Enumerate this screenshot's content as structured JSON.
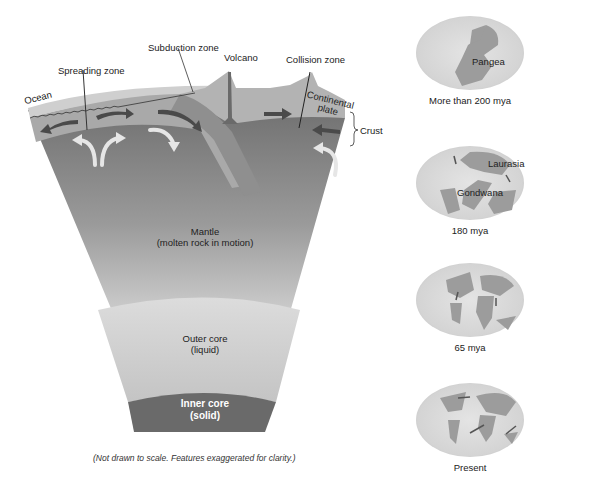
{
  "cross_section": {
    "labels": {
      "ocean": "Ocean",
      "spreading_zone": "Spreading zone",
      "subduction_zone": "Subduction zone",
      "volcano": "Volcano",
      "collision_zone": "Collision zone",
      "continental_plate_line1": "Continental",
      "continental_plate_line2": "plate",
      "crust": "Crust",
      "mantle_title": "Mantle",
      "mantle_desc": "(molten rock in motion)",
      "outer_core_title": "Outer core",
      "outer_core_desc": "(liquid)",
      "inner_core_title": "Inner core",
      "inner_core_desc": "(solid)"
    },
    "caption": "(Not drawn to scale. Features exaggerated for clarity.)",
    "colors": {
      "ocean": "#c9c9c9",
      "crust": "#a6a6a6",
      "upper_mantle": "#6f6f6f",
      "mantle_light": "#c8c8c8",
      "outer_core": "#d2d2d2",
      "inner_core": "#6a6a6a",
      "arrow_dark": "#4a4a4a",
      "arrow_light": "#e6e6e6"
    }
  },
  "maps": [
    {
      "label": "Pangea",
      "caption": "More than 200 mya"
    },
    {
      "labels": [
        "Laurasia",
        "Gondwana"
      ],
      "caption": "180 mya"
    },
    {
      "caption": "65 mya"
    },
    {
      "caption": "Present"
    }
  ]
}
